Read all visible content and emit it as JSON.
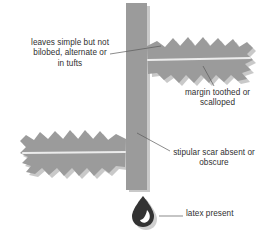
{
  "diagram": {
    "background_color": "#ffffff",
    "stem_color": "#9a9a9a",
    "leaf_color": "#9a9a9a",
    "midrib_color": "#e8e8e8",
    "shadow_color": "#c8c8c8",
    "droplet_color": "#333333",
    "droplet_highlight_color": "#ffffff",
    "leader_line_color": "#555555",
    "text_color": "#2f2f2f"
  },
  "labels": {
    "leaves": "leaves simple but not\nbilobed, alternate or\nin tufts",
    "margin": "margin toothed or\nscalloped",
    "stipular": "stipular scar absent or\nobscure",
    "latex": "latex present"
  },
  "parts": {
    "stem": "vertical-stem",
    "upper_leaf": "toothed-leaf-upper-right",
    "lower_leaf": "toothed-leaf-lower-left",
    "droplet": "latex-droplet"
  }
}
